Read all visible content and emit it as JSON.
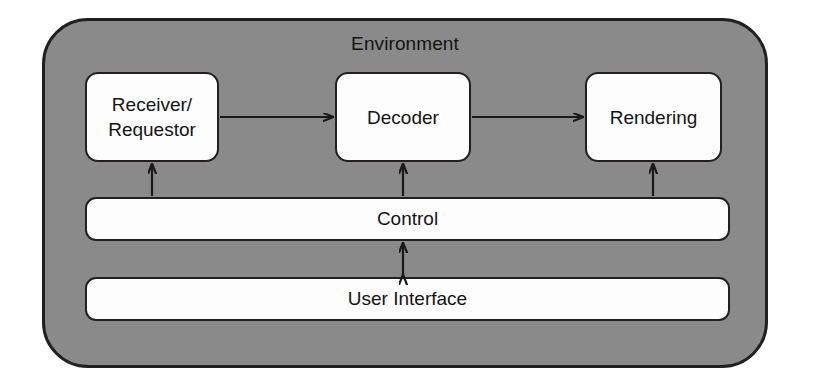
{
  "diagram": {
    "title": "Environment",
    "container_label": "Environment",
    "background_color": "#8a8a8a",
    "node_fill_color": "#fdfdfd",
    "stroke_color": "#231f20",
    "nodes": [
      {
        "id": "receiver",
        "label": "Receiver/\nRequestor",
        "shape": "rounded-rect"
      },
      {
        "id": "decoder",
        "label": "Decoder",
        "shape": "rounded-rect"
      },
      {
        "id": "rendering",
        "label": "Rendering",
        "shape": "rounded-rect"
      },
      {
        "id": "control",
        "label": "Control",
        "shape": "rounded-bar"
      },
      {
        "id": "ui",
        "label": "User Interface",
        "shape": "rounded-bar"
      }
    ],
    "edges": [
      {
        "from": "receiver",
        "to": "decoder",
        "direction": "one-way",
        "orientation": "horizontal"
      },
      {
        "from": "decoder",
        "to": "rendering",
        "direction": "one-way",
        "orientation": "horizontal"
      },
      {
        "from": "control",
        "to": "receiver",
        "direction": "one-way",
        "orientation": "vertical"
      },
      {
        "from": "control",
        "to": "decoder",
        "direction": "one-way",
        "orientation": "vertical"
      },
      {
        "from": "control",
        "to": "rendering",
        "direction": "one-way",
        "orientation": "vertical"
      },
      {
        "from": "control",
        "to": "ui",
        "direction": "two-way",
        "orientation": "vertical"
      }
    ]
  }
}
